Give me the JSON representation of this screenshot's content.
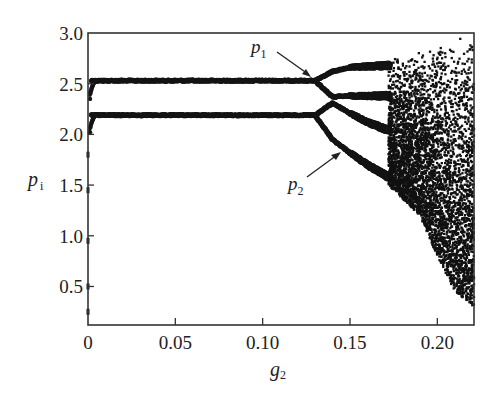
{
  "chart_data": {
    "type": "scatter",
    "title": "",
    "xlabel": "g2",
    "xlabel_main": "g",
    "xlabel_sub": "2",
    "ylabel": "p_i",
    "ylabel_main": "p",
    "ylabel_sub": "i",
    "xlim": [
      0,
      0.221
    ],
    "ylim": [
      0.12,
      3.0
    ],
    "x_ticks": [
      0,
      0.05,
      0.1,
      0.15,
      0.2
    ],
    "x_tick_labels": [
      "0",
      "0.05",
      "0.10",
      "0.15",
      "0.20"
    ],
    "y_ticks": [
      0.5,
      1.0,
      1.5,
      2.0,
      2.5,
      3.0
    ],
    "y_tick_labels": [
      "0.5",
      "1.0",
      "1.5",
      "2.0",
      "2.5",
      "3.0"
    ],
    "grid": false,
    "legend": null,
    "series": [
      {
        "name": "p1 branch (stable)",
        "x": [
          0.002,
          0.13
        ],
        "y": [
          2.53,
          2.53
        ]
      },
      {
        "name": "p2 branch (stable)",
        "x": [
          0.002,
          0.13
        ],
        "y": [
          2.19,
          2.19
        ]
      },
      {
        "name": "p1 upper bifurcated",
        "x": [
          0.13,
          0.14,
          0.15,
          0.16,
          0.172
        ],
        "y": [
          2.53,
          2.62,
          2.66,
          2.67,
          2.68
        ]
      },
      {
        "name": "p1 lower bifurcated",
        "x": [
          0.13,
          0.14,
          0.15,
          0.16,
          0.172
        ],
        "y": [
          2.53,
          2.37,
          2.38,
          2.38,
          2.38
        ]
      },
      {
        "name": "p2 upper bifurcated",
        "x": [
          0.13,
          0.14,
          0.15,
          0.16,
          0.172
        ],
        "y": [
          2.19,
          2.31,
          2.21,
          2.12,
          2.04
        ]
      },
      {
        "name": "p2 lower bifurcated",
        "x": [
          0.13,
          0.14,
          0.15,
          0.16,
          0.172
        ],
        "y": [
          2.19,
          1.95,
          1.82,
          1.7,
          1.58
        ]
      },
      {
        "name": "transient at g2≈0",
        "x": [
          0.0,
          0.0,
          0.0,
          0.0,
          0.0,
          0.001,
          0.001
        ],
        "y": [
          0.25,
          0.5,
          0.95,
          1.45,
          1.8,
          2.05,
          2.4
        ]
      }
    ],
    "chaotic_region": {
      "x_range": [
        0.172,
        0.221
      ],
      "y_range_top": [
        2.75,
        3.0
      ],
      "y_bottom_at_x": [
        [
          0.172,
          1.5
        ],
        [
          0.19,
          1.2
        ],
        [
          0.2,
          0.8
        ],
        [
          0.21,
          0.45
        ],
        [
          0.221,
          0.3
        ]
      ]
    },
    "annotations": [
      {
        "text": "p1",
        "main": "p",
        "sub": "1",
        "arrow_to": [
          0.128,
          2.54
        ]
      },
      {
        "text": "p2",
        "main": "p",
        "sub": "2",
        "arrow_to": [
          0.144,
          1.88
        ]
      }
    ]
  }
}
